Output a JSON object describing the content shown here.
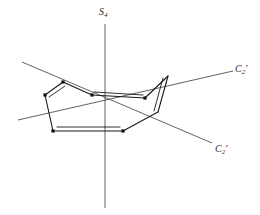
{
  "figure": {
    "molecule_name": "cyclooctatetraene",
    "background_color": "#ffffff",
    "line_color": "#1a1a1a",
    "axis_color": "#3a3a3a"
  },
  "axes": [
    {
      "id": "s4",
      "label_main": "S",
      "label_sub": "4",
      "label_prime": "",
      "symmetry_type": "improper-rotation-axis",
      "orientation": "vertical",
      "x1": 105,
      "y1": 24,
      "x2": 105,
      "y2": 208
    },
    {
      "id": "c2-prime-upper",
      "label_main": "C",
      "label_sub": "2",
      "label_prime": "′",
      "symmetry_type": "two-fold-rotation-axis",
      "orientation": "diagonal-ascending",
      "x1": 18,
      "y1": 120,
      "x2": 233,
      "y2": 71
    },
    {
      "id": "c2-prime-lower",
      "label_main": "C",
      "label_sub": "2",
      "label_prime": "′",
      "symmetry_type": "two-fold-rotation-axis",
      "orientation": "diagonal-descending",
      "x1": 22,
      "y1": 62,
      "x2": 212,
      "y2": 143
    }
  ],
  "skeleton": {
    "vertices": [
      {
        "id": "v1",
        "x": 63,
        "y": 82
      },
      {
        "id": "v2",
        "x": 45,
        "y": 95
      },
      {
        "id": "v3",
        "x": 53,
        "y": 131
      },
      {
        "id": "v4",
        "x": 123,
        "y": 131
      },
      {
        "id": "v5",
        "x": 168,
        "y": 76
      },
      {
        "id": "v6",
        "x": 145,
        "y": 98
      },
      {
        "id": "v7",
        "x": 92,
        "y": 95
      },
      {
        "id": "v8",
        "x": 158,
        "y": 112
      }
    ],
    "single_bonds": [
      {
        "from": "v2",
        "to": "v3"
      },
      {
        "from": "v3",
        "to": "v4"
      },
      {
        "from": "v4",
        "to": "v8"
      },
      {
        "from": "v5",
        "to": "v6"
      },
      {
        "from": "v6",
        "to": "v7"
      },
      {
        "from": "v7",
        "to": "v1"
      },
      {
        "from": "v1",
        "to": "v2"
      },
      {
        "from": "v8",
        "to": "v5"
      }
    ],
    "double_bonds": [
      {
        "from": "v1",
        "to": "v2",
        "offset": "inner-right"
      },
      {
        "from": "v3",
        "to": "v4",
        "offset": "inner-up"
      },
      {
        "from": "v6",
        "to": "v7",
        "offset": "inner-up"
      },
      {
        "from": "v5",
        "to": "v8",
        "offset": "inner-left"
      }
    ]
  }
}
